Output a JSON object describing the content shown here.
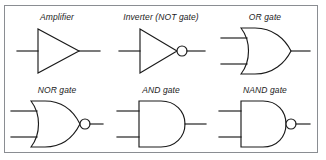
{
  "figure": {
    "border_color": "#8a8d92",
    "line_color": "#1a1a1a",
    "background": "#ffffff",
    "columns": 3,
    "rows": 2
  },
  "cells": [
    {
      "id": "amplifier",
      "label": "Amplifier",
      "symbol": "triangle",
      "inputs": 1,
      "inverting_bubble": false
    },
    {
      "id": "inverter",
      "label": "Inverter (NOT gate)",
      "symbol": "triangle",
      "inputs": 1,
      "inverting_bubble": true
    },
    {
      "id": "or-gate",
      "label": "OR gate",
      "symbol": "or-shield",
      "inputs": 2,
      "inverting_bubble": false
    },
    {
      "id": "nor-gate",
      "label": "NOR gate",
      "symbol": "or-shield",
      "inputs": 2,
      "inverting_bubble": true
    },
    {
      "id": "and-gate",
      "label": "AND gate",
      "symbol": "and-dshape",
      "inputs": 2,
      "inverting_bubble": false
    },
    {
      "id": "nand-gate",
      "label": "NAND gate",
      "symbol": "and-dshape",
      "inputs": 2,
      "inverting_bubble": true
    }
  ]
}
